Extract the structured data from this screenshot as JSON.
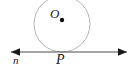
{
  "figure": {
    "type": "geometry-diagram",
    "background_color": "#ffffff",
    "labels": {
      "center_label": "O",
      "tangent_point_label": "P",
      "line_label": "n"
    },
    "circle": {
      "center_x": 62,
      "center_y": 24,
      "radius": 28,
      "stroke_color": "#b5b5b5",
      "stroke_width": 1,
      "fill": "none"
    },
    "center_point": {
      "x": 62,
      "y": 20,
      "radius": 2.2,
      "color": "#111111"
    },
    "line": {
      "x1": 11,
      "x2": 127,
      "y": 52,
      "stroke_color": "#4a4a4a",
      "stroke_width": 1,
      "left_arrow": true,
      "right_arrow": true,
      "arrow_color": "#1a1a1a"
    }
  }
}
